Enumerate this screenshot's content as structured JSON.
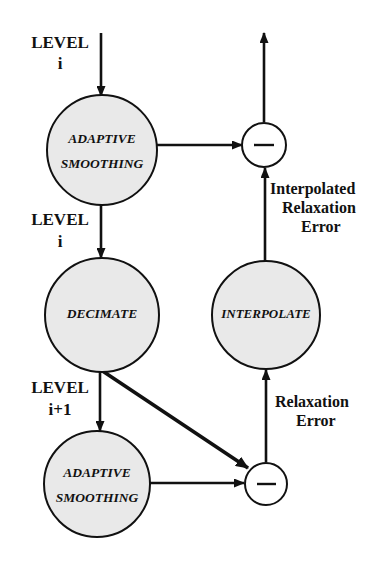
{
  "diagram": {
    "colors": {
      "node_fill": "#e9e9e9",
      "stroke": "#111111",
      "background": "#ffffff",
      "sum_fill": "#ffffff"
    },
    "nodes": [
      {
        "id": "adaptive-smoothing-top",
        "kind": "process",
        "label_lines": [
          "ADAPTIVE",
          "SMOOTHING"
        ],
        "cx": 102,
        "cy": 150,
        "r": 55
      },
      {
        "id": "decimate",
        "kind": "process",
        "label_lines": [
          "DECIMATE"
        ],
        "cx": 102,
        "cy": 315,
        "r": 57
      },
      {
        "id": "adaptive-smoothing-bottom",
        "kind": "process",
        "label_lines": [
          "ADAPTIVE",
          "SMOOTHING"
        ],
        "cx": 97,
        "cy": 484,
        "r": 53
      },
      {
        "id": "interpolate",
        "kind": "process",
        "label_lines": [
          "INTERPOLATE"
        ],
        "cx": 266,
        "cy": 315,
        "r": 54
      },
      {
        "id": "summing-junction-top",
        "kind": "summing-junction",
        "label_lines": [
          "−"
        ],
        "cx": 264,
        "cy": 145,
        "r": 22
      },
      {
        "id": "summing-junction-bottom",
        "kind": "summing-junction",
        "label_lines": [
          "−"
        ],
        "cx": 266,
        "cy": 484,
        "r": 21
      }
    ],
    "labels": [
      {
        "id": "level-i-top",
        "lines": [
          "LEVEL",
          "i"
        ],
        "x": 60,
        "y": 44,
        "line_height": 21,
        "size": 17
      },
      {
        "id": "level-i-middle",
        "lines": [
          "LEVEL",
          "i"
        ],
        "x": 60,
        "y": 221,
        "line_height": 21,
        "size": 17
      },
      {
        "id": "level-i-plus-1",
        "lines": [
          "LEVEL",
          "i+1"
        ],
        "x": 60,
        "y": 389,
        "line_height": 21,
        "size": 17
      },
      {
        "id": "interpolated-relaxation-error",
        "lines": [
          "Interpolated",
          "Relaxation",
          "Error"
        ],
        "x": 271,
        "y": 190,
        "line_height": 19,
        "size": 16,
        "align": "start"
      },
      {
        "id": "relaxation-error",
        "lines": [
          "Relaxation",
          "Error"
        ],
        "x": 271,
        "y": 403,
        "line_height": 19,
        "size": 16,
        "align": "start"
      }
    ],
    "connections": [
      {
        "id": "input-to-adaptive-smoothing-top",
        "from": "LEVEL i input",
        "to": "adaptive-smoothing-top",
        "style": "arrow-down"
      },
      {
        "id": "adaptive-smoothing-top-to-junction-top",
        "from": "adaptive-smoothing-top",
        "to": "summing-junction-top",
        "style": "arrow-right"
      },
      {
        "id": "junction-top-to-output",
        "from": "summing-junction-top",
        "to": "output",
        "style": "arrow-up"
      },
      {
        "id": "adaptive-smoothing-top-to-decimate",
        "from": "adaptive-smoothing-top",
        "to": "decimate",
        "style": "arrow-down"
      },
      {
        "id": "decimate-to-adaptive-smoothing-bottom",
        "from": "decimate",
        "to": "adaptive-smoothing-bottom",
        "style": "arrow-down"
      },
      {
        "id": "decimate-to-junction-bottom",
        "from": "decimate",
        "to": "summing-junction-bottom",
        "style": "arrow-diagonal"
      },
      {
        "id": "adaptive-smoothing-bottom-to-junction-bottom",
        "from": "adaptive-smoothing-bottom",
        "to": "summing-junction-bottom",
        "style": "arrow-right"
      },
      {
        "id": "junction-bottom-to-interpolate",
        "from": "summing-junction-bottom",
        "to": "interpolate",
        "style": "arrow-up"
      },
      {
        "id": "interpolate-to-junction-top",
        "from": "interpolate",
        "to": "summing-junction-top",
        "style": "arrow-up"
      }
    ]
  }
}
